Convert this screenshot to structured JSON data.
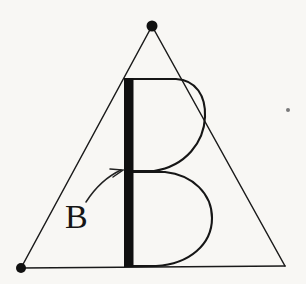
{
  "figure": {
    "background_color": "#f8f7f4",
    "ink_color": "#151515",
    "annotation_label": "B",
    "letter_glyph": "B"
  },
  "triangle": {
    "name": "enclosing-triangle",
    "apex": {
      "x": 152,
      "y": 26,
      "has_dot": true
    },
    "bottom_left": {
      "x": 21,
      "y": 268,
      "has_dot": true
    },
    "bottom_right": {
      "x": 285,
      "y": 266,
      "has_dot": false
    },
    "stroke_color": "#1a1a1a",
    "stroke_width": 1.5,
    "vertex_dot_radius": 5
  },
  "letter_b": {
    "name": "large-letter-b",
    "stem": {
      "x_left": 124,
      "x_right": 133,
      "y_top": 78,
      "y_bottom": 267,
      "fill_color": "#101010",
      "width": 9
    },
    "upper_bowl": {
      "y_top": 78,
      "y_bottom": 172,
      "x_right_extent": 205
    },
    "lower_bowl": {
      "y_top": 172,
      "y_bottom": 267,
      "x_right_extent": 212
    },
    "stroke_color": "#161616",
    "stroke_width": 2.1
  },
  "annotation": {
    "name": "b-callout",
    "label": "B",
    "label_x": 67,
    "label_y": 227,
    "font_size": 34,
    "arrow": {
      "start_x": 88,
      "start_y": 200,
      "end_x": 124,
      "end_y": 170,
      "has_arrowhead": true
    }
  },
  "artifacts": {
    "speck": {
      "x": 288,
      "y": 110,
      "radius": 2,
      "color": "#7a7a7a"
    }
  }
}
